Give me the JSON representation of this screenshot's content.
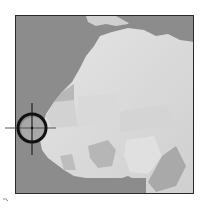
{
  "map": {
    "region": "West Africa",
    "style": "grayscale shaded relief",
    "colors": {
      "ocean": "#8c8c8c",
      "land": "#d6d6d6",
      "land_dark": "#b4b4b4",
      "frame": "#2a2a2a",
      "target": "#111111"
    },
    "target": {
      "icon": "crosshair-icon",
      "center_x": 32,
      "center_y": 128,
      "radius": 14
    }
  }
}
